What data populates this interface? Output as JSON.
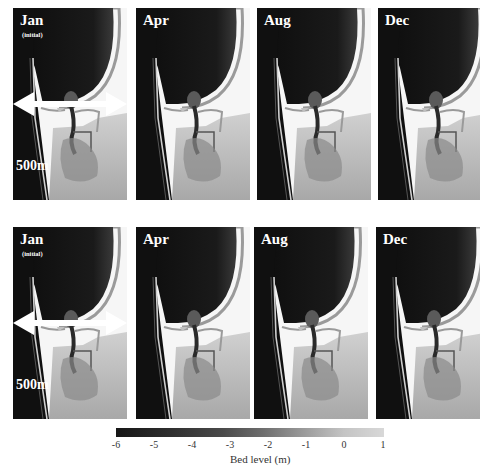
{
  "figure": {
    "rows": [
      {
        "panels": [
          {
            "month": "Jan",
            "subtitle": "(initial)",
            "scale_label": "500m"
          },
          {
            "month": "Apr"
          },
          {
            "month": "Aug"
          },
          {
            "month": "Dec"
          }
        ]
      },
      {
        "panels": [
          {
            "month": "Jan",
            "subtitle": "(initial)",
            "scale_label": "500m"
          },
          {
            "month": "Apr"
          },
          {
            "month": "Aug"
          },
          {
            "month": "Dec"
          }
        ]
      }
    ],
    "colorbar": {
      "label": "Bed level (m)",
      "ticks": [
        "-6",
        "-5",
        "-4",
        "-3",
        "-2",
        "-1",
        "0",
        "1"
      ],
      "range": [
        -6,
        1
      ],
      "colors": {
        "low": "#161616",
        "high": "#d8d8d8"
      }
    }
  }
}
